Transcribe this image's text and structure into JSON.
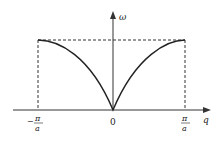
{
  "figure": {
    "y_axis_label": "ω",
    "x_axis_label": "q",
    "tick_labels": {
      "left": {
        "sign": "−",
        "numerator": "π",
        "denominator": "a"
      },
      "center": "0",
      "right": {
        "numerator": "π",
        "denominator": "a"
      }
    },
    "colors": {
      "curve": "#222222",
      "axis": "#333333",
      "dashed": "#333333"
    }
  }
}
